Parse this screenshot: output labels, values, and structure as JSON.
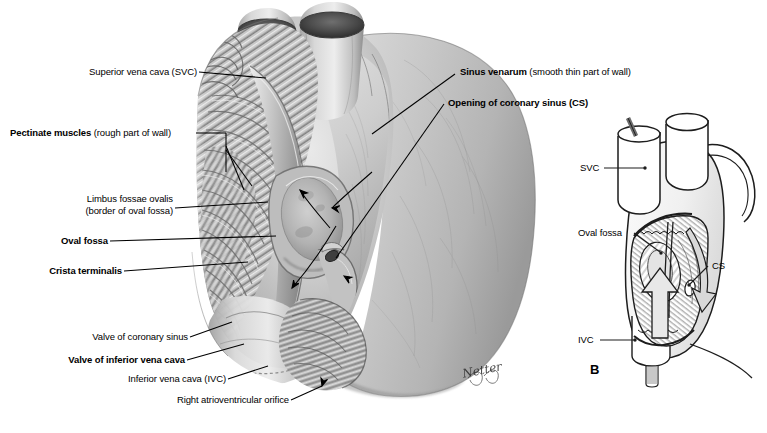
{
  "figure": {
    "background_color": "#ffffff",
    "label_color": "#000000",
    "leader_color": "#000000",
    "width": 767,
    "height": 433
  },
  "main_panel": {
    "name": "right-atrium-interior",
    "labels": [
      {
        "id": "svc",
        "bold_text": "",
        "regular_text": "Superior vena cava (SVC)",
        "align": "right"
      },
      {
        "id": "pectinate",
        "bold_text": "Pectinate muscles",
        "regular_text": " (rough part of wall)",
        "align": "left"
      },
      {
        "id": "limbus-line1",
        "bold_text": "",
        "regular_text": "Limbus fossae ovalis",
        "align": "right"
      },
      {
        "id": "limbus-line2",
        "bold_text": "",
        "regular_text": "(border of oval fossa)",
        "align": "right"
      },
      {
        "id": "oval-fossa",
        "bold_text": "Oval fossa",
        "regular_text": "",
        "align": "right"
      },
      {
        "id": "crista",
        "bold_text": "Crista terminalis",
        "regular_text": "",
        "align": "right"
      },
      {
        "id": "valve-cs",
        "bold_text": "",
        "regular_text": "Valve of coronary sinus",
        "align": "right"
      },
      {
        "id": "valve-ivc",
        "bold_text": "Valve of inferior vena cava",
        "regular_text": "",
        "align": "right"
      },
      {
        "id": "ivc",
        "bold_text": "",
        "regular_text": "Inferior vena cava (IVC)",
        "align": "right"
      },
      {
        "id": "rav-orifice",
        "bold_text": "",
        "regular_text": "Right atrioventricular orifice",
        "align": "right"
      },
      {
        "id": "sinus-venarum",
        "bold_text": "Sinus venarum",
        "regular_text": " (smooth thin part of wall)",
        "align": "left"
      },
      {
        "id": "opening-cs",
        "bold_text": "Opening of coronary sinus (CS)",
        "regular_text": "",
        "align": "left"
      }
    ],
    "signature": "Netter"
  },
  "inset_panel": {
    "name": "orientation-inset",
    "panel_id": "B",
    "labels": [
      {
        "id": "inset-svc",
        "text": "SVC"
      },
      {
        "id": "inset-oval-fossa",
        "text": "Oval fossa"
      },
      {
        "id": "inset-cs",
        "text": "CS"
      },
      {
        "id": "inset-ivc",
        "text": "IVC"
      }
    ]
  }
}
